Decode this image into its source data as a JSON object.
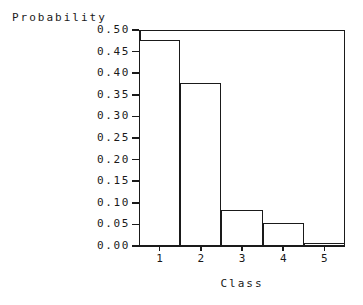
{
  "chart_data": {
    "type": "bar",
    "title": "",
    "xlabel": "Class",
    "ylabel": "Probability",
    "categories": [
      "1",
      "2",
      "3",
      "4",
      "5"
    ],
    "values": [
      0.477,
      0.378,
      0.083,
      0.053,
      0.007
    ],
    "ylim": [
      0.0,
      0.5
    ],
    "xlim": [
      0.5,
      5.5
    ],
    "yticks": [
      0.0,
      0.05,
      0.1,
      0.15,
      0.2,
      0.25,
      0.3,
      0.35,
      0.4,
      0.45,
      0.5
    ],
    "ytick_labels": [
      "0.00",
      "0.05",
      "0.10",
      "0.15",
      "0.20",
      "0.25",
      "0.30",
      "0.35",
      "0.40",
      "0.45",
      "0.50"
    ],
    "xticks": [
      1,
      2,
      3,
      4,
      5
    ],
    "xtick_labels": [
      "1",
      "2",
      "3",
      "4",
      "5"
    ],
    "grid": false,
    "legend": null,
    "bar_style": {
      "fill": "#ffffff",
      "edge": "#1a1a1a",
      "edge_width": 1.5,
      "width": 1.0
    },
    "frame": {
      "color": "#1a1a1a",
      "background": "#ffffff"
    }
  },
  "axes": {
    "y_title": "Probability",
    "x_title": "Class"
  }
}
